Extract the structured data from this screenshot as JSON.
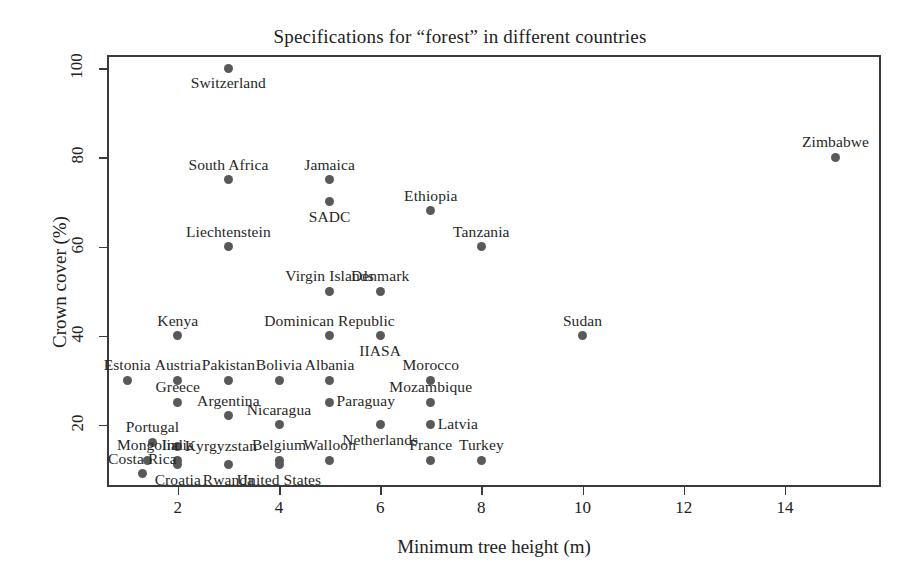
{
  "chart_data": {
    "type": "scatter",
    "title": "Specifications for “forest” in different countries",
    "xlabel": "Minimum tree height (m)",
    "ylabel": "Crown cover (%)",
    "xlim": [
      0.6,
      15.9
    ],
    "ylim": [
      6,
      103
    ],
    "xticks": [
      2,
      4,
      6,
      8,
      10,
      12,
      14
    ],
    "yticks": [
      20,
      40,
      60,
      80,
      100
    ],
    "grid": false,
    "legend": false,
    "marker_color": "#595959",
    "axis_color": "#3a3a3a",
    "points": [
      {
        "label": "Switzerland",
        "x": 3,
        "y": 100,
        "label_pos": "below"
      },
      {
        "label": "South Africa",
        "x": 3,
        "y": 75,
        "label_pos": "above"
      },
      {
        "label": "Jamaica",
        "x": 5,
        "y": 75,
        "label_pos": "above"
      },
      {
        "label": "SADC",
        "x": 5,
        "y": 70,
        "label_pos": "below"
      },
      {
        "label": "Ethiopia",
        "x": 7,
        "y": 68,
        "label_pos": "above"
      },
      {
        "label": "Liechtenstein",
        "x": 3,
        "y": 60,
        "label_pos": "above"
      },
      {
        "label": "Tanzania",
        "x": 8,
        "y": 60,
        "label_pos": "above"
      },
      {
        "label": "Zimbabwe",
        "x": 15,
        "y": 80,
        "label_pos": "above"
      },
      {
        "label": "Virgin Islands",
        "x": 5,
        "y": 50,
        "label_pos": "above"
      },
      {
        "label": "Denmark",
        "x": 6,
        "y": 50,
        "label_pos": "above"
      },
      {
        "label": "Kenya",
        "x": 2,
        "y": 40,
        "label_pos": "above"
      },
      {
        "label": "Dominican Republic",
        "x": 5,
        "y": 40,
        "label_pos": "above"
      },
      {
        "label": "IIASA",
        "x": 6,
        "y": 40,
        "label_pos": "below"
      },
      {
        "label": "Sudan",
        "x": 10,
        "y": 40,
        "label_pos": "above"
      },
      {
        "label": "Estonia",
        "x": 1,
        "y": 30,
        "label_pos": "above"
      },
      {
        "label": "Austria",
        "x": 2,
        "y": 30,
        "label_pos": "above"
      },
      {
        "label": "Pakistan",
        "x": 3,
        "y": 30,
        "label_pos": "above"
      },
      {
        "label": "Bolivia",
        "x": 4,
        "y": 30,
        "label_pos": "above"
      },
      {
        "label": "Albania",
        "x": 5,
        "y": 30,
        "label_pos": "above"
      },
      {
        "label": "Morocco",
        "x": 7,
        "y": 30,
        "label_pos": "above"
      },
      {
        "label": "Greece",
        "x": 2,
        "y": 25,
        "label_pos": "above"
      },
      {
        "label": "Mozambique",
        "x": 7,
        "y": 25,
        "label_pos": "above"
      },
      {
        "label": "Paraguay",
        "x": 5,
        "y": 25,
        "label_pos": "right"
      },
      {
        "label": "Argentina",
        "x": 3,
        "y": 22,
        "label_pos": "above"
      },
      {
        "label": "Nicaragua",
        "x": 4,
        "y": 20,
        "label_pos": "above"
      },
      {
        "label": "Netherlands",
        "x": 6,
        "y": 20,
        "label_pos": "below"
      },
      {
        "label": "Latvia",
        "x": 7,
        "y": 20,
        "label_pos": "right"
      },
      {
        "label": "Portugal",
        "x": 1.5,
        "y": 16,
        "label_pos": "above"
      },
      {
        "label": "Kyrgyzstan",
        "x": 2,
        "y": 15,
        "label_pos": "right"
      },
      {
        "label": "Mongolia",
        "x": 1.4,
        "y": 12,
        "label_pos": "above"
      },
      {
        "label": "India",
        "x": 2,
        "y": 12,
        "label_pos": "above"
      },
      {
        "label": "Belgium",
        "x": 4,
        "y": 12,
        "label_pos": "above"
      },
      {
        "label": "Walloon",
        "x": 5,
        "y": 12,
        "label_pos": "above"
      },
      {
        "label": "France",
        "x": 7,
        "y": 12,
        "label_pos": "above"
      },
      {
        "label": "Turkey",
        "x": 8,
        "y": 12,
        "label_pos": "above"
      },
      {
        "label": "Croatia",
        "x": 2,
        "y": 11,
        "label_pos": "below"
      },
      {
        "label": "Rwanda",
        "x": 3,
        "y": 11,
        "label_pos": "below"
      },
      {
        "label": "Costa Rica",
        "x": 1.3,
        "y": 9,
        "label_pos": "above"
      },
      {
        "label": "United States",
        "x": 4,
        "y": 11,
        "label_pos": "below"
      }
    ]
  }
}
